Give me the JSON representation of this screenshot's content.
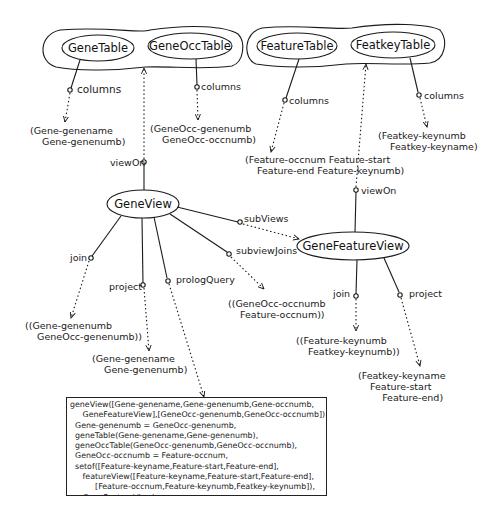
{
  "groups": {
    "gene_tables": [
      "GeneTable",
      "GeneOccTable"
    ],
    "feature_tables": [
      "FeatureTable",
      "FeatkeyTable"
    ]
  },
  "nodes": {
    "gene_table": "GeneTable",
    "gene_occ_table": "GeneOccTable",
    "feature_table": "FeatureTable",
    "featkey_table": "FeatkeyTable",
    "gene_view": "GeneView",
    "gene_feature_view": "GeneFeatureView"
  },
  "edges": {
    "gene_table_columns": "columns",
    "gene_occ_table_columns": "columns",
    "feature_table_columns": "columns",
    "featkey_table_columns": "columns",
    "gene_view_viewon": "viewOn",
    "gene_view_subviews": "subViews",
    "gene_view_subviewjoins": "subviewJoins",
    "gene_view_join": "join",
    "gene_view_project": "project",
    "gene_view_prologquery": "prologQuery",
    "gene_feature_view_viewon": "viewOn",
    "gene_feature_view_join": "join",
    "gene_feature_view_project": "project"
  },
  "values": {
    "gene_table_columns": "(Gene-genename\n    Gene-genenumb)",
    "gene_occ_table_columns": "(GeneOcc-genenumb\n    GeneOcc-occnumb)",
    "feature_table_columns": "(Feature-occnum Feature-start\n    Feature-end Feature-keynumb)",
    "featkey_table_columns": "(Featkey-keynumb\n    Featkey-keyname)",
    "gene_view_join": "((Gene-genenumb\n    GeneOcc-genenumb))",
    "gene_view_project": "(Gene-genename\n    Gene-genenumb)",
    "gene_view_subviewjoins": "((GeneOcc-occnumb\n    Feature-occnum))",
    "gene_feature_view_join": "((Feature-keynumb\n    Featkey-keynumb))",
    "gene_feature_view_project": "(Featkey-keyname\n    Feature-start\n        Feature-end)"
  },
  "prolog_query": {
    "lines": [
      "geneView([Gene-genename,Gene-genenumb,Gene-occnumb,",
      "     GeneFeatureView],[GeneOcc-genenumb,GeneOcc-occnumb]) :-",
      "  Gene-genenumb = GeneOcc-genenumb,",
      "  geneTable(Gene-genename,Gene-genenumb),",
      "  geneOccTable(GeneOcc-genenumb,GeneOcc-occnumb),",
      "  GeneOcc-occnumb = Feature-occnum,",
      "  setof([Feature-keyname,Feature-start,Feature-end],",
      "     featureView([Feature-keyname,Feature-start,Feature-end],",
      "          [Feature-occnum,Feature-keynumb,Featkey-keynumb]),",
      "     GeneFeatureView)."
    ],
    "text": "geneView([Gene-genename,Gene-genenumb,Gene-occnumb,\n     GeneFeatureView],[GeneOcc-genenumb,GeneOcc-occnumb]) :-\n  Gene-genenumb = GeneOcc-genenumb,\n  geneTable(Gene-genename,Gene-genenumb),\n  geneOccTable(GeneOcc-genenumb,GeneOcc-occnumb),\n  GeneOcc-occnumb = Feature-occnum,\n  setof([Feature-keyname,Feature-start,Feature-end],\n     featureView([Feature-keyname,Feature-start,Feature-end],\n          [Feature-occnum,Feature-keynumb,Featkey-keynumb]),\n     GeneFeatureView)."
  },
  "colors": {
    "ink": "#1a1a1a",
    "background": "#ffffff"
  }
}
